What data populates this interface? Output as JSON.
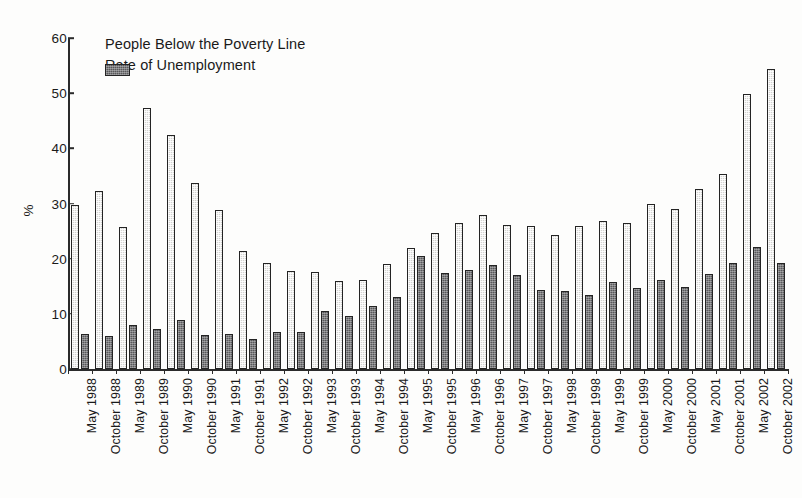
{
  "chart_data": {
    "type": "bar",
    "title": "",
    "subtitle": "",
    "xlabel": "",
    "ylabel": "%",
    "ylim": [
      0,
      60
    ],
    "yticks": [
      0,
      10,
      20,
      30,
      40,
      50,
      60
    ],
    "grid": false,
    "legend_position": "top-left",
    "categories": [
      "May 1988",
      "October 1988",
      "May 1989",
      "October 1989",
      "May 1990",
      "October 1990",
      "May 1991",
      "October 1991",
      "May 1992",
      "October 1992",
      "May 1993",
      "October 1993",
      "May 1994",
      "October 1994",
      "May 1995",
      "October 1995",
      "May 1996",
      "October 1996",
      "May 1997",
      "October 1997",
      "May 1998",
      "October 1998",
      "May 1999",
      "October 1999",
      "May 2000",
      "October 2000",
      "May 2001",
      "October 2001",
      "May 2002",
      "October 2002"
    ],
    "series": [
      {
        "name": "People Below the Poverty Line",
        "color": "#d3d3d0",
        "values": [
          29.7,
          32.2,
          25.7,
          47.3,
          42.4,
          33.7,
          28.9,
          21.4,
          19.2,
          17.8,
          17.6,
          15.9,
          16.2,
          19.0,
          22.0,
          24.7,
          26.5,
          27.9,
          26.1,
          25.9,
          24.3,
          25.9,
          26.9,
          26.4,
          29.9,
          29.0,
          32.7,
          35.4,
          49.8,
          54.3
        ]
      },
      {
        "name": "Rate of Unemployment",
        "color": "#58585a",
        "values": [
          6.3,
          6.0,
          7.9,
          7.2,
          8.8,
          6.1,
          6.3,
          5.4,
          6.7,
          6.8,
          10.6,
          9.7,
          11.4,
          13.0,
          20.5,
          17.4,
          18.0,
          18.9,
          17.0,
          14.4,
          14.2,
          13.5,
          15.7,
          14.7,
          16.1,
          14.9,
          17.2,
          19.2,
          22.1,
          19.2
        ]
      }
    ]
  },
  "legend": {
    "items": [
      {
        "label": "People Below the Poverty Line",
        "swatch": "light"
      },
      {
        "label": "Rate of Unemployment",
        "swatch": "dark"
      }
    ]
  }
}
